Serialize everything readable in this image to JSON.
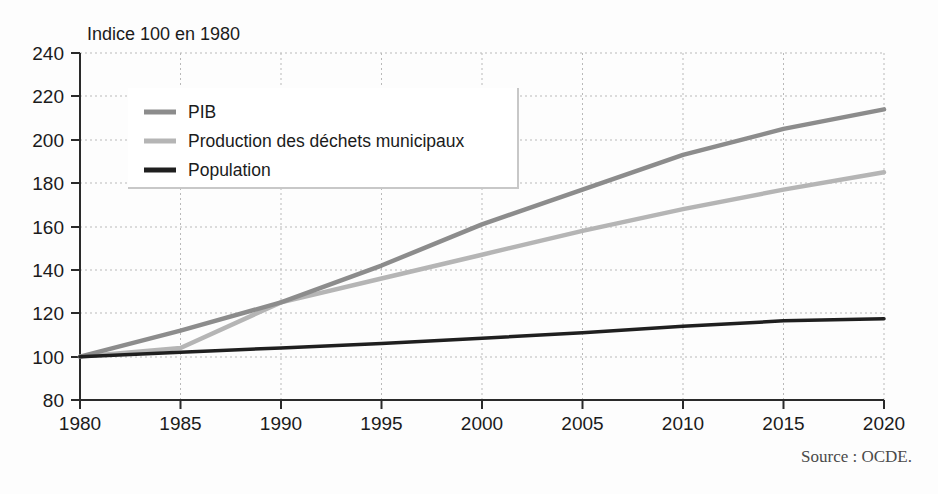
{
  "chart_data": {
    "type": "line",
    "title": "",
    "ylabel": "Indice 100 en 1980",
    "xlabel": "",
    "xlim": [
      1980,
      2020
    ],
    "ylim": [
      80,
      240
    ],
    "ytick_step": 20,
    "xtick_step": 5,
    "grid": true,
    "legend_position": "top-left inside plot",
    "x": [
      1980,
      1985,
      1990,
      1995,
      2000,
      2005,
      2010,
      2015,
      2020
    ],
    "xticklabels": [
      "1980",
      "1985",
      "1990",
      "1995",
      "2000",
      "2005",
      "2010",
      "2015",
      "2020"
    ],
    "yticklabels": [
      "80",
      "100",
      "120",
      "140",
      "160",
      "180",
      "200",
      "220",
      "240"
    ],
    "series": [
      {
        "name": "PIB",
        "color": "#8c8c8c",
        "values": [
          100,
          112,
          125,
          142,
          161,
          177,
          193,
          205,
          214
        ]
      },
      {
        "name": "Production des déchets municipaux",
        "color": "#b5b5b5",
        "values": [
          100,
          104,
          125,
          136,
          147,
          158,
          168,
          177,
          185
        ]
      },
      {
        "name": "Population",
        "color": "#1f1f1f",
        "values": [
          100,
          102,
          104,
          106,
          108.5,
          111,
          114,
          116.5,
          117.5
        ]
      }
    ],
    "annotations": {
      "source": "Source : OCDE."
    }
  },
  "legend": {
    "entries": [
      {
        "label": "PIB",
        "color": "#8c8c8c"
      },
      {
        "label": "Production des déchets municipaux",
        "color": "#b5b5b5"
      },
      {
        "label": "Population",
        "color": "#1f1f1f"
      }
    ]
  },
  "colors": {
    "axis": "#2a2a2a",
    "grid": "#b9b9b9",
    "background": "#fdfdfd",
    "legend_border": "#c8c8c8",
    "source_text": "#4a4a4a"
  }
}
